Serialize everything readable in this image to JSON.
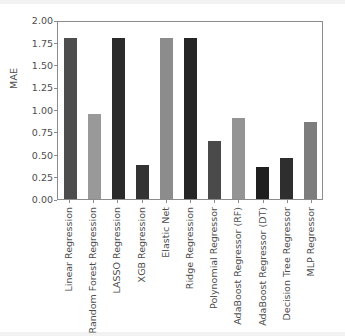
{
  "chart_data": {
    "type": "bar",
    "title": "",
    "xlabel": "",
    "ylabel": "MAE",
    "ylim": [
      0.0,
      2.0
    ],
    "grid": false,
    "legend": null,
    "categories": [
      "Linear Regression",
      "Random Forest Regression",
      "LASSO Regression",
      "XGB Regression",
      "Elastic Net",
      "Ridge Regression",
      "Polynomial Regressor",
      "AdaBoost Regressor (RF)",
      "AdaBoost Regressor (DT)",
      "Decision Tree Regressor",
      "MLP Regressor"
    ],
    "values": [
      1.8,
      0.95,
      1.8,
      0.38,
      1.8,
      1.8,
      0.65,
      0.91,
      0.36,
      0.46,
      0.86
    ],
    "bar_colors": [
      "#4d4d4d",
      "#999999",
      "#2b2b2b",
      "#333333",
      "#8c8c8c",
      "#262626",
      "#4a4a4a",
      "#949494",
      "#1f1f1f",
      "#2e2e2e",
      "#7d7d7d"
    ],
    "ytick_labels": [
      "0.00",
      "0.25",
      "0.50",
      "0.75",
      "1.00",
      "1.25",
      "1.50",
      "1.75",
      "2.00"
    ],
    "ytick_values": [
      0.0,
      0.25,
      0.5,
      0.75,
      1.0,
      1.25,
      1.5,
      1.75,
      2.0
    ],
    "axis_color": "#8c8c8c",
    "text_color": "#4d4d4d",
    "background": "#ffffff"
  }
}
